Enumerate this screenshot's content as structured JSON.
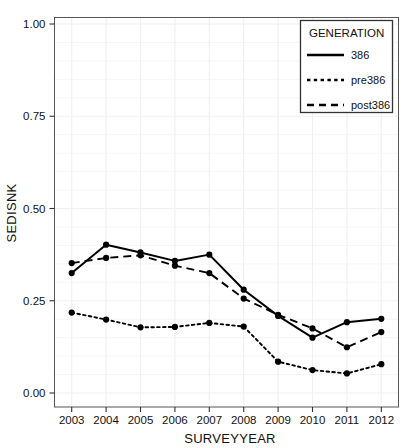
{
  "chart_data": {
    "type": "line",
    "title": "",
    "xlabel": "SURVEYYEAR",
    "ylabel": "SEDISNK",
    "categories": [
      2003,
      2004,
      2005,
      2006,
      2007,
      2008,
      2009,
      2010,
      2011,
      2012
    ],
    "xlim": [
      2002.6,
      2012.4
    ],
    "ylim": [
      0.0,
      1.0
    ],
    "ytick_labels": [
      "0.00",
      "0.25",
      "0.50",
      "0.75",
      "1.00"
    ],
    "ytick_values": [
      0.0,
      0.25,
      0.5,
      0.75,
      1.0
    ],
    "xtick_labels": [
      "2003",
      "2004",
      "2005",
      "2006",
      "2007",
      "2008",
      "2009",
      "2010",
      "2011",
      "2012"
    ],
    "grid": true,
    "grid_color": "#f0f0f0",
    "legend_position": "top-right",
    "legend_title": "GENERATION",
    "series": [
      {
        "name": "386",
        "style": "solid",
        "color": "#000000",
        "values": [
          0.325,
          0.402,
          0.381,
          0.358,
          0.375,
          0.28,
          0.209,
          0.15,
          0.192,
          0.201
        ]
      },
      {
        "name": "pre386",
        "style": "dotted",
        "color": "#000000",
        "values": [
          0.218,
          0.199,
          0.178,
          0.179,
          0.19,
          0.18,
          0.085,
          0.062,
          0.053,
          0.078
        ]
      },
      {
        "name": "post386",
        "style": "dashed",
        "color": "#000000",
        "values": [
          0.352,
          0.366,
          0.373,
          0.345,
          0.325,
          0.256,
          0.212,
          0.175,
          0.124,
          0.165
        ]
      }
    ]
  },
  "legend": {
    "title": "GENERATION",
    "entries": [
      {
        "label": "386",
        "style": "solid"
      },
      {
        "label": "pre386",
        "style": "dotted"
      },
      {
        "label": "post386",
        "style": "dashed"
      }
    ]
  },
  "axes": {
    "y_title": "SEDISNK",
    "x_title": "SURVEYYEAR"
  }
}
